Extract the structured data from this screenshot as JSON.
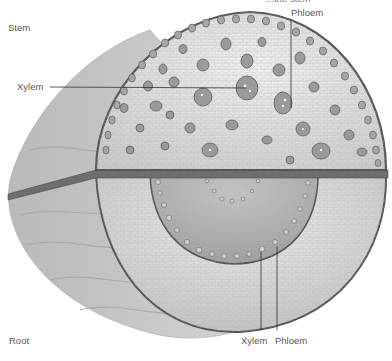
{
  "diagram": {
    "title_fragment": "...the stem",
    "labels": {
      "stem": "Stem",
      "root": "Root",
      "stem_xylem": "Xylem",
      "stem_phloem": "Phloem",
      "root_xylem": "Xylem",
      "root_phloem": "Phloem"
    },
    "colors": {
      "background": "#ffffff",
      "outer_bark": "#c8c8c8",
      "cortex": "#dcdcdc",
      "epidermis_ring": "#5a5a5a",
      "divider": "#6e6e6e",
      "vascular_bundle": "#9a9a9a",
      "root_stele": "#b8b8b8",
      "leader_line": "#333333",
      "label_text": "#555555"
    }
  }
}
